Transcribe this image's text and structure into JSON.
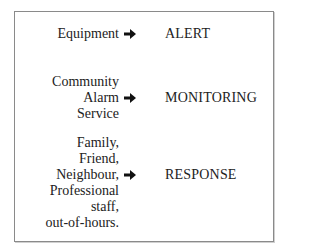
{
  "diagram": {
    "rows": [
      {
        "source": [
          "Equipment"
        ],
        "arrow": "right-arrow",
        "target": "ALERT"
      },
      {
        "source": [
          "Community",
          "Alarm",
          "Service"
        ],
        "arrow": "right-arrow",
        "target": "MONITORING"
      },
      {
        "source": [
          "Family,",
          "Friend,",
          "Neighbour,",
          "Professional",
          "staff,",
          "out-of-hours."
        ],
        "arrow": "right-arrow",
        "target": "RESPONSE"
      }
    ]
  }
}
